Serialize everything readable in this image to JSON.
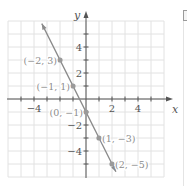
{
  "chart_data": {
    "type": "line",
    "title": "",
    "xlabel": "x",
    "ylabel": "y",
    "xlim": [
      -6,
      6
    ],
    "ylim": [
      -6,
      6
    ],
    "grid": true,
    "x_tick_labels": [
      "-4",
      "2",
      "4"
    ],
    "x_tick_values": [
      -4,
      2,
      4
    ],
    "y_tick_labels": [
      "4",
      "2",
      "-2",
      "-4"
    ],
    "y_tick_values": [
      4,
      2,
      -2,
      -4
    ],
    "series": [
      {
        "name": "y = -2x - 1",
        "line": {
          "slope": -2,
          "intercept": -1,
          "x_from": -3.4,
          "x_to": 2.3
        },
        "points": [
          {
            "x": -2,
            "y": 3,
            "label": "(−2, 3)"
          },
          {
            "x": -1,
            "y": 1,
            "label": "(−1, 1)"
          },
          {
            "x": 0,
            "y": -1,
            "label": "(0, −1)"
          },
          {
            "x": 1,
            "y": -3,
            "label": "(1, −3)"
          },
          {
            "x": 2,
            "y": -5,
            "label": "(2, −5)"
          }
        ]
      }
    ],
    "colors": {
      "line": "#8a8a8a",
      "points": "#9a9a9a",
      "grid": "#e2e2e2",
      "axes": "#555555",
      "text": "#8c8c8c",
      "axis_label": "#555555"
    }
  }
}
